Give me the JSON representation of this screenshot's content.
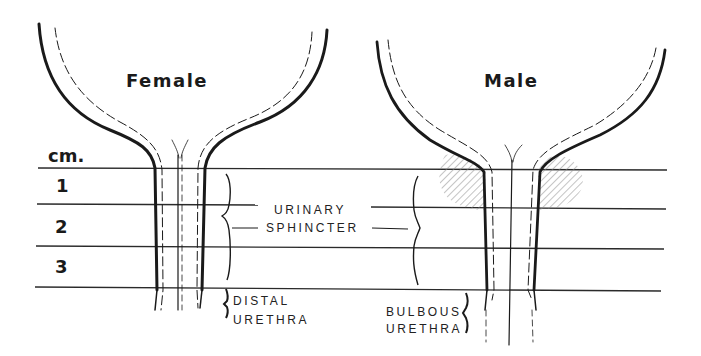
{
  "figure": {
    "panels": [
      {
        "id": "female",
        "title": "Female"
      },
      {
        "id": "male",
        "title": "Male"
      }
    ],
    "scale": {
      "unit_label": "cm.",
      "marks": [
        "1",
        "2",
        "3"
      ]
    },
    "labels": {
      "urinary_sphincter_line1": "URINARY",
      "urinary_sphincter_line2": "SPHINCTER",
      "female_distal_line1": "DISTAL",
      "female_distal_line2": "URETHRA",
      "male_bulbous_line1": "BULBOUS",
      "male_bulbous_line2": "URETHRA"
    },
    "colors": {
      "ink": "#1a1a1a",
      "hatch": "#8a8a8a",
      "background": "#ffffff"
    }
  }
}
